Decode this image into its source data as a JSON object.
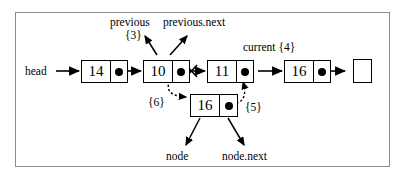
{
  "diagram": {
    "list_nodes": [
      {
        "value": "14"
      },
      {
        "value": "10"
      },
      {
        "value": "11"
      },
      {
        "value": "16"
      }
    ],
    "new_node": {
      "value": "16"
    },
    "head_label": "head",
    "null_terminator": "null",
    "labels": {
      "previous": "previous",
      "previous_step": "{3}",
      "previous_next": "previous.next",
      "current": "current {4}",
      "step5": "{5}",
      "step6": "{6}",
      "node": "node",
      "node_next": "node.next"
    },
    "colors": {
      "stroke": "#000000",
      "frame": "#8c8c8c",
      "background": "#ffffff"
    }
  }
}
